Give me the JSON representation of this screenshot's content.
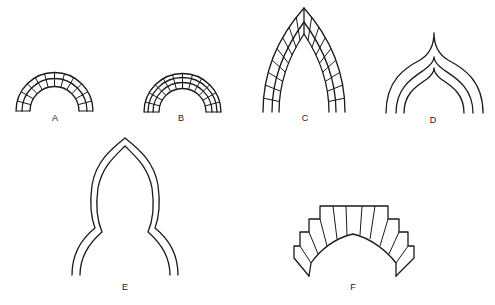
{
  "figure": {
    "arches": [
      {
        "id": "A",
        "label": "A",
        "type": "semicircular arch with voussoirs, two rings"
      },
      {
        "id": "B",
        "label": "B",
        "type": "semicircular arch with voussoirs, three rings"
      },
      {
        "id": "C",
        "label": "C",
        "type": "pointed (gothic) arch with voussoirs"
      },
      {
        "id": "D",
        "label": "D",
        "type": "ogee arch, three rings"
      },
      {
        "id": "E",
        "label": "E",
        "type": "bulbous / keel-shaped arch, double outline"
      },
      {
        "id": "F",
        "label": "F",
        "type": "stepped-extrados arch with wedge voussoirs"
      }
    ]
  }
}
